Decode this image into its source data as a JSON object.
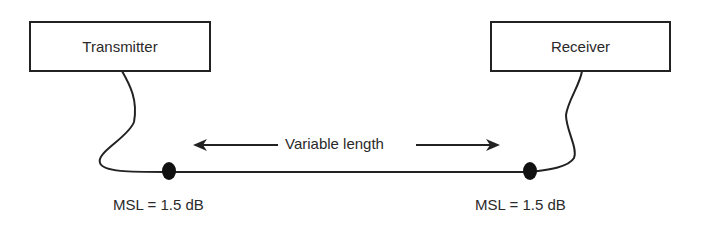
{
  "diagram": {
    "transmitter": {
      "label": "Transmitter"
    },
    "receiver": {
      "label": "Receiver"
    },
    "cable": {
      "length_label": "Variable length"
    },
    "connectors": [
      {
        "label": "MSL = 1.5 dB"
      },
      {
        "label": "MSL = 1.5 dB"
      }
    ]
  }
}
